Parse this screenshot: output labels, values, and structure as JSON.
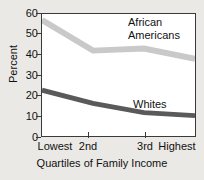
{
  "top_cropped_text": "",
  "axes": {
    "ylabel": "Percent",
    "xlabel": "Quartiles of Family Income",
    "yticks": [
      "60",
      "50",
      "40",
      "30",
      "20",
      "10",
      "0"
    ],
    "xticklabels": [
      "Lowest",
      "2nd",
      "3rd",
      "Highest"
    ]
  },
  "series_labels": {
    "african_americans_line1": "African",
    "african_americans_line2": "Americans",
    "whites": "Whites"
  },
  "colors": {
    "african_americans": "#c9c9c9",
    "whites": "#5a5a5a",
    "axis": "#3a3a3a",
    "plot_background": "#ffffff",
    "page_background": "#ebe9e5"
  },
  "chart_data": {
    "type": "line",
    "title": "",
    "xlabel": "Quartiles of Family Income",
    "ylabel": "Percent",
    "categories": [
      "Lowest",
      "2nd",
      "3rd",
      "Highest"
    ],
    "series": [
      {
        "name": "African Americans",
        "values": [
          57,
          42,
          43,
          38
        ],
        "color": "#c9c9c9"
      },
      {
        "name": "Whites",
        "values": [
          22.5,
          16,
          11.5,
          10
        ],
        "color": "#5a5a5a"
      }
    ],
    "ylim": [
      0,
      60
    ],
    "yticks": [
      0,
      10,
      20,
      30,
      40,
      50,
      60
    ],
    "grid": false,
    "legend": "inline-annotations"
  }
}
